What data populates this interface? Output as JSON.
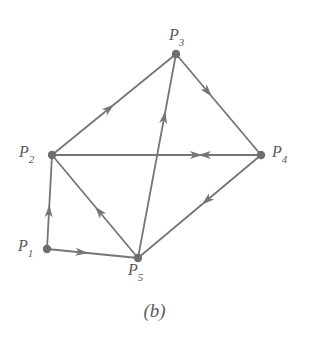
{
  "figure": {
    "caption": "(b)",
    "caption_x": 145,
    "caption_y": 300,
    "width": 309,
    "height": 354,
    "background_color": "#ffffff",
    "stroke_color": "#767676",
    "node_fill_color": "#6e6e6e",
    "label_color": "#5a5a5a",
    "stroke_width": 1.8,
    "node_radius": 4.2
  },
  "chart_data": {
    "type": "diagram",
    "subtype": "directed-graph",
    "title": "(b)",
    "nodes": [
      {
        "id": "P1",
        "base": "P",
        "sub": "1",
        "x": 47,
        "y": 249,
        "label_x": 18,
        "label_y": 238
      },
      {
        "id": "P2",
        "base": "P",
        "sub": "2",
        "x": 52,
        "y": 155,
        "label_x": 19,
        "label_y": 144
      },
      {
        "id": "P3",
        "base": "P",
        "sub": "3",
        "x": 176,
        "y": 54,
        "label_x": 169,
        "label_y": 27
      },
      {
        "id": "P4",
        "base": "P",
        "sub": "4",
        "x": 261,
        "y": 155,
        "label_x": 272,
        "label_y": 144
      },
      {
        "id": "P5",
        "base": "P",
        "sub": "5",
        "x": 138,
        "y": 258,
        "label_x": 128,
        "label_y": 262
      }
    ],
    "edges": [
      {
        "from": "P2",
        "to": "P3",
        "arrow_t": 0.5,
        "directed": true
      },
      {
        "from": "P5",
        "to": "P3",
        "arrow_t": 0.72,
        "directed": true
      },
      {
        "from": "P3",
        "to": "P4",
        "arrow_t": 0.42,
        "directed": true
      },
      {
        "from": "P4",
        "to": "P5",
        "arrow_t": 0.48,
        "directed": true
      },
      {
        "from": "P5",
        "to": "P2",
        "arrow_t": 0.5,
        "directed": true
      },
      {
        "from": "P1",
        "to": "P2",
        "arrow_t": 0.47,
        "directed": true
      },
      {
        "from": "P1",
        "to": "P5",
        "arrow_t": 0.45,
        "directed": true
      },
      {
        "from": "P4",
        "to": "P2",
        "arrow_t": 0.3,
        "directed": true,
        "shared_segment": "P2-P4"
      },
      {
        "from": "P2",
        "to": "P4",
        "arrow_t": 0.72,
        "directed": true,
        "shared_segment": "P2-P4"
      }
    ],
    "adjacency_description": "P1 to P2, P1 to P5, P2 to P3, P2 to P4, P4 to P2, P3 to P4, P4 to P5, P5 to P2, P5 to P3",
    "xlabel": "",
    "ylabel": "",
    "grid": false,
    "legend": null
  }
}
